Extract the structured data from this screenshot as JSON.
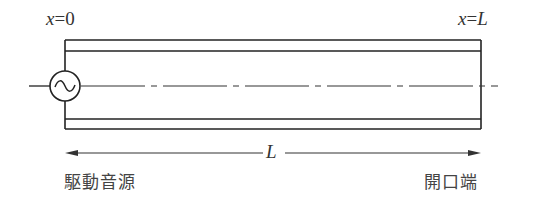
{
  "diagram": {
    "type": "acoustic-tube",
    "labels": {
      "left_position": {
        "var": "x",
        "eq": "=",
        "val": "0"
      },
      "right_position": {
        "var": "x",
        "eq": "=",
        "val": "L"
      },
      "length": "L",
      "source": "駆動音源",
      "open_end": "開口端"
    },
    "components": {
      "source_symbol": "~",
      "tube": "double-walled tube",
      "centerline": "dash-dot axis",
      "dimension_arrow": "double-headed arrow spanning L"
    },
    "colors": {
      "line": "#222222",
      "text": "#333333",
      "background": "#ffffff"
    }
  }
}
